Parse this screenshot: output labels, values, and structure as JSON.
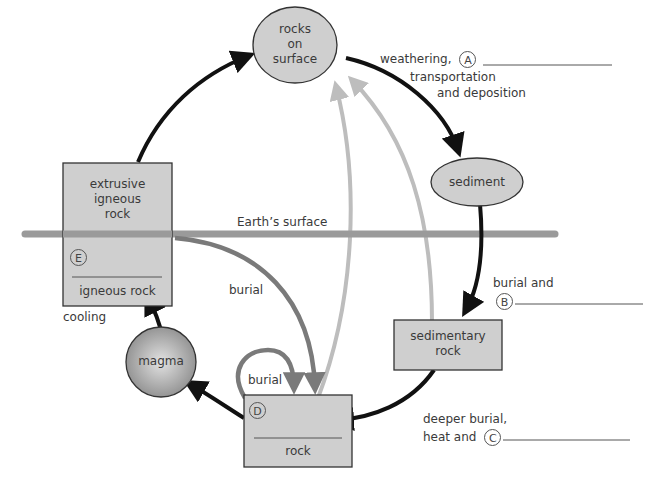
{
  "colors": {
    "black_arrow": "#111111",
    "mid_grey_arrow": "#7a7a7a",
    "light_grey_arrow": "#bdbdbd",
    "surface_line": "#9a9a9a",
    "node_fill": "#cfcfcf",
    "node_stroke": "#333333"
  },
  "nodes": {
    "rocks_on_surface": {
      "line1": "rocks",
      "line2": "on",
      "line3": "surface"
    },
    "sediment": {
      "label": "sediment"
    },
    "sedimentary_rock": {
      "line1": "sedimentary",
      "line2": "rock"
    },
    "rock_d": {
      "marker": "D",
      "label": "rock"
    },
    "magma": {
      "label": "magma"
    },
    "igneous": {
      "top_line1": "extrusive",
      "top_line2": "igneous",
      "top_line3": "rock",
      "marker": "E",
      "bottom_label": "igneous rock"
    }
  },
  "labels": {
    "weathering": "weathering,",
    "marker_a": "A",
    "transportation": "transportation",
    "and_deposition": "and deposition",
    "burial_and": "burial and",
    "marker_b": "B",
    "deeper_burial": "deeper burial,",
    "heat_and": "heat and",
    "marker_c": "C",
    "earths_surface": "Earth’s surface",
    "burial_1": "burial",
    "burial_2": "burial",
    "cooling": "cooling"
  }
}
